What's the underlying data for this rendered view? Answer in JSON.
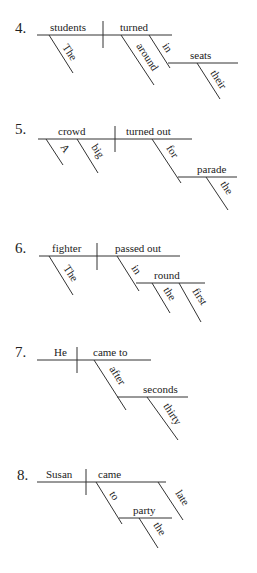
{
  "diagrams": [
    {
      "number": "4.",
      "subject": "students",
      "predicate": "turned",
      "modifiers": {
        "subject_1": "The",
        "predicate_1": "around",
        "preposition": "in",
        "object": "seats",
        "object_mod": "their"
      }
    },
    {
      "number": "5.",
      "subject": "crowd",
      "predicate": "turned out",
      "modifiers": {
        "subject_1": "A",
        "subject_2": "big",
        "preposition": "for",
        "object": "parade",
        "object_mod": "the"
      }
    },
    {
      "number": "6.",
      "subject": "fighter",
      "predicate": "passed out",
      "modifiers": {
        "subject_1": "The",
        "preposition": "in",
        "object": "round",
        "object_mod_1": "the",
        "object_mod_2": "first"
      }
    },
    {
      "number": "7.",
      "subject": "He",
      "predicate": "came to",
      "modifiers": {
        "preposition": "after",
        "object": "seconds",
        "object_mod": "thirty"
      }
    },
    {
      "number": "8.",
      "subject": "Susan",
      "predicate": "came",
      "modifiers": {
        "preposition": "to",
        "object": "party",
        "object_mod": "the",
        "predicate_mod": "late"
      }
    }
  ]
}
